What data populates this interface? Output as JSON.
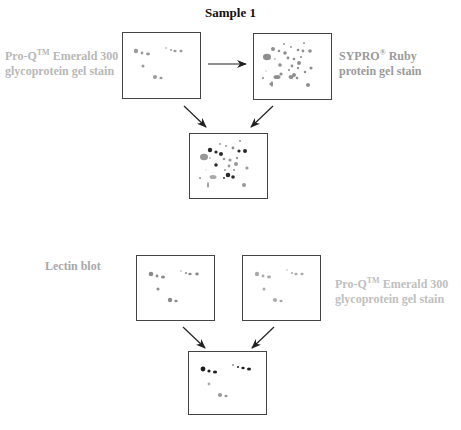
{
  "title": "Sample 1",
  "top_panel": {
    "left_label": {
      "line1_prefix": "Pro-Q",
      "line1_sup": "TM",
      "line1_suffix": " Emerald 300",
      "line2": "glycoprotein gel stain",
      "color": "#b8b8b8"
    },
    "right_label": {
      "line1_prefix": "SYPRO",
      "line1_sup": "®",
      "line1_suffix": " Ruby",
      "line2": "protein gel stain",
      "color": "#a0a0a0"
    },
    "gels": [
      "emerald-300-gel",
      "sypro-ruby-gel",
      "merged-gel"
    ]
  },
  "bottom_panel": {
    "left_label": {
      "text": "Lectin blot",
      "color": "#a8a8a8"
    },
    "right_label": {
      "line1_prefix": "Pro-Q",
      "line1_sup": "TM",
      "line1_suffix": " Emerald 300",
      "line2": "glycoprotein gel stain",
      "color": "#c0c0c0"
    },
    "gels": [
      "lectin-blot-gel",
      "emerald-300-gel",
      "merged-gel"
    ]
  },
  "colors": {
    "box_border": "#444444",
    "arrow": "#222222",
    "spot_light": "#9a9a9a",
    "spot_dark": "#2a2a2a"
  }
}
